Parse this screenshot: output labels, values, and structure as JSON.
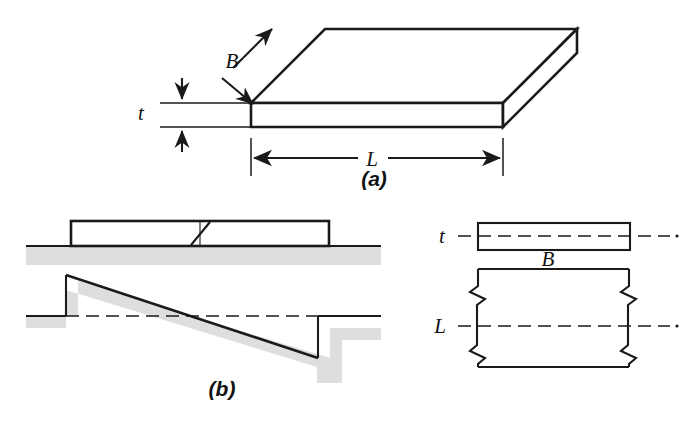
{
  "figure": {
    "panels": [
      {
        "id": "a",
        "caption": "(a)",
        "caption_x": 374,
        "caption_y": 186,
        "description": "Isometric view of a rectangular plate",
        "labels": [
          {
            "name": "thickness",
            "text": "t",
            "x": 141,
            "y": 118
          },
          {
            "name": "breadth",
            "text": "B",
            "x": 232,
            "y": 65
          },
          {
            "name": "length",
            "text": "L",
            "x": 368,
            "y": 166
          }
        ]
      },
      {
        "id": "b",
        "caption": "(b)",
        "caption_x": 222,
        "caption_y": 395,
        "description": "Elevation of plate on ground with tilted settlement profile",
        "labels": []
      },
      {
        "id": "c",
        "description": "Plan and edge view with centerlines and break symbols",
        "labels": [
          {
            "name": "thickness",
            "text": "t",
            "x": 439,
            "y": 243
          },
          {
            "name": "breadth",
            "text": "B",
            "x": 545,
            "y": 267
          },
          {
            "name": "length",
            "text": "L",
            "x": 437,
            "y": 330
          }
        ]
      }
    ]
  },
  "colors": {
    "line": "#1a1a1a",
    "shadow": "#dedede",
    "face": "#ffffff",
    "background": "#ffffff"
  },
  "symbols": {
    "break_symbol": "break-line",
    "zigzag_symbol": "zigzag-break",
    "centerline": "dash-dot-centerline",
    "dimension_arrow": "double-headed-arrow"
  }
}
